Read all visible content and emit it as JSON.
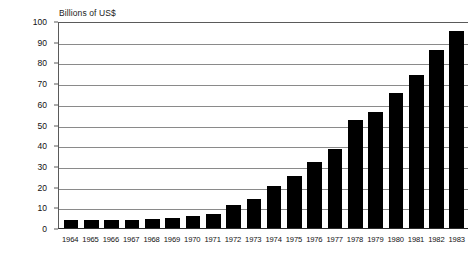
{
  "chart_data": {
    "type": "bar",
    "title": "",
    "subtitle": "",
    "ylabel": "Billions of US$",
    "xlabel": "",
    "ylim": [
      0,
      100
    ],
    "yticks": [
      0,
      10,
      20,
      30,
      40,
      50,
      60,
      70,
      80,
      90,
      100
    ],
    "ytick_labels": [
      "0",
      "10",
      "20",
      "30",
      "40",
      "50",
      "60",
      "70",
      "80",
      "90",
      "100"
    ],
    "grid": "horizontal",
    "legend": "none",
    "bar_color": "#000000",
    "gridline_color": "#8a8a8a",
    "axis_color": "#5a5a5a",
    "background": "#ffffff",
    "categories": [
      "1964",
      "1965",
      "1966",
      "1967",
      "1968",
      "1969",
      "1970",
      "1971",
      "1972",
      "1973",
      "1974",
      "1975",
      "1976",
      "1977",
      "1978",
      "1979",
      "1980",
      "1981",
      "1982",
      "1983"
    ],
    "values": [
      4,
      4,
      4,
      4,
      4.5,
      5,
      6,
      7,
      11,
      14,
      20.5,
      25,
      32,
      38,
      52,
      56,
      65,
      74,
      86,
      95
    ]
  }
}
